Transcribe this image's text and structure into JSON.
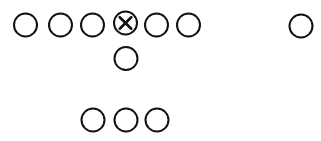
{
  "diagram": {
    "type": "football-formation",
    "stroke_color": "#111111",
    "background": "#ffffff",
    "radius": 11.5,
    "players": [
      {
        "id": "p1",
        "role": "player",
        "cx": 25.5,
        "cy": 25,
        "marker": "circle"
      },
      {
        "id": "p2",
        "role": "player",
        "cx": 60.5,
        "cy": 25,
        "marker": "circle"
      },
      {
        "id": "p3",
        "role": "player",
        "cx": 92.5,
        "cy": 25,
        "marker": "circle"
      },
      {
        "id": "center",
        "role": "center",
        "cx": 125.5,
        "cy": 23,
        "marker": "circle-x"
      },
      {
        "id": "p5",
        "role": "player",
        "cx": 156.5,
        "cy": 25,
        "marker": "circle"
      },
      {
        "id": "p6",
        "role": "player",
        "cx": 188.5,
        "cy": 25,
        "marker": "circle"
      },
      {
        "id": "p7",
        "role": "wide-player",
        "cx": 301,
        "cy": 26,
        "marker": "circle"
      },
      {
        "id": "qb",
        "role": "quarterback",
        "cx": 126,
        "cy": 58.5,
        "marker": "circle"
      },
      {
        "id": "b1",
        "role": "back",
        "cx": 93,
        "cy": 120,
        "marker": "circle"
      },
      {
        "id": "b2",
        "role": "back",
        "cx": 126,
        "cy": 120,
        "marker": "circle"
      },
      {
        "id": "b3",
        "role": "back",
        "cx": 157,
        "cy": 120,
        "marker": "circle"
      }
    ]
  }
}
